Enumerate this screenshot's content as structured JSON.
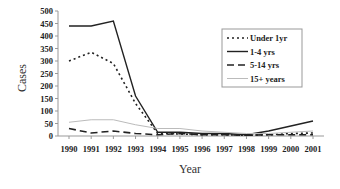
{
  "chart_data": {
    "type": "line",
    "title": "",
    "xlabel": "Year",
    "ylabel": "Cases",
    "ylim": [
      0,
      500
    ],
    "yticks": [
      0,
      50,
      100,
      150,
      200,
      250,
      300,
      350,
      400,
      450,
      500
    ],
    "categories": [
      "1990",
      "1991",
      "1992",
      "1993",
      "1994",
      "1995",
      "1996",
      "1997",
      "1998",
      "1999",
      "2000",
      "2001"
    ],
    "grid": false,
    "legend_position": "upper right",
    "series": [
      {
        "name": "Under 1yr",
        "style": "dotted",
        "color": "#222222",
        "values": [
          300,
          335,
          290,
          130,
          10,
          8,
          5,
          5,
          3,
          5,
          10,
          12
        ]
      },
      {
        "name": "1-4 yrs",
        "style": "solid",
        "color": "#222222",
        "values": [
          440,
          440,
          460,
          160,
          15,
          15,
          10,
          10,
          5,
          20,
          40,
          60
        ]
      },
      {
        "name": "5-14 yrs",
        "style": "dashed",
        "color": "#222222",
        "values": [
          30,
          12,
          20,
          10,
          5,
          10,
          5,
          5,
          3,
          5,
          5,
          5
        ]
      },
      {
        "name": "15+ years",
        "style": "solid-light",
        "color": "#bbbbbb",
        "values": [
          55,
          65,
          65,
          45,
          30,
          30,
          20,
          15,
          10,
          10,
          15,
          20
        ]
      }
    ]
  }
}
